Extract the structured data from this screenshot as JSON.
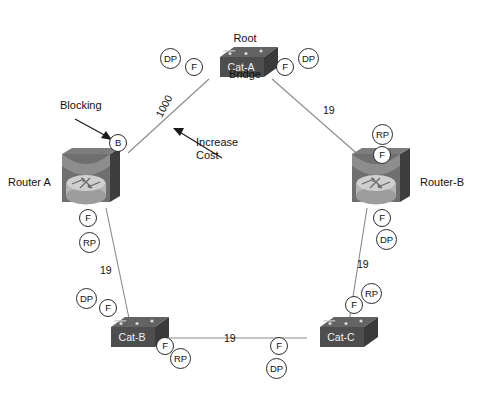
{
  "diagram": {
    "annotations": {
      "root_bridge": "Root\nBridge",
      "root_bridge_line1": "Root",
      "root_bridge_line2": "Bridge",
      "blocking": "Blocking",
      "increase_cost_line1": "Increase",
      "increase_cost_line2": "Cost"
    },
    "devices": [
      {
        "id": "cat-a",
        "name": "Cat-A",
        "type": "switch"
      },
      {
        "id": "router-a",
        "name": "Router A",
        "type": "router"
      },
      {
        "id": "router-b",
        "name": "Router-B",
        "type": "router"
      },
      {
        "id": "cat-b",
        "name": "Cat-B",
        "type": "switch"
      },
      {
        "id": "cat-c",
        "name": "Cat-C",
        "type": "switch"
      }
    ],
    "links": [
      {
        "id": "cata-routera",
        "from": "cat-a",
        "to": "router-a",
        "cost": "1000"
      },
      {
        "id": "cata-routerb",
        "from": "cat-a",
        "to": "router-b",
        "cost": "19"
      },
      {
        "id": "routera-catb",
        "from": "router-a",
        "to": "cat-b",
        "cost": "19"
      },
      {
        "id": "routerb-catc",
        "from": "router-b",
        "to": "cat-c",
        "cost": "19"
      },
      {
        "id": "catb-catc",
        "from": "cat-b",
        "to": "cat-c",
        "cost": "19"
      }
    ],
    "port_roles": [
      {
        "id": "cata-left-dp",
        "device": "cat-a",
        "label": "DP"
      },
      {
        "id": "cata-left-f",
        "device": "cat-a",
        "label": "F"
      },
      {
        "id": "cata-right-f",
        "device": "cat-a",
        "label": "F"
      },
      {
        "id": "cata-right-dp",
        "device": "cat-a",
        "label": "DP"
      },
      {
        "id": "routera-top-b",
        "device": "router-a",
        "label": "B"
      },
      {
        "id": "routera-bot-f",
        "device": "router-a",
        "label": "F"
      },
      {
        "id": "routera-bot-rp",
        "device": "router-a",
        "label": "RP"
      },
      {
        "id": "routerb-top-rp",
        "device": "router-b",
        "label": "RP"
      },
      {
        "id": "routerb-top-f",
        "device": "router-b",
        "label": "F"
      },
      {
        "id": "routerb-bot-f",
        "device": "router-b",
        "label": "F"
      },
      {
        "id": "routerb-bot-dp",
        "device": "router-b",
        "label": "DP"
      },
      {
        "id": "catb-top-dp",
        "device": "cat-b",
        "label": "DP"
      },
      {
        "id": "catb-top-f",
        "device": "cat-b",
        "label": "F"
      },
      {
        "id": "catb-right-f",
        "device": "cat-b",
        "label": "F"
      },
      {
        "id": "catb-right-rp",
        "device": "cat-b",
        "label": "RP"
      },
      {
        "id": "catc-top-rp",
        "device": "cat-c",
        "label": "RP"
      },
      {
        "id": "catc-top-f",
        "device": "cat-c",
        "label": "F"
      },
      {
        "id": "catc-left-f",
        "device": "cat-c",
        "label": "F"
      },
      {
        "id": "catc-left-dp",
        "device": "cat-c",
        "label": "DP"
      }
    ],
    "colors": {
      "background": "#ffffff",
      "line": "#8a8a8a",
      "text": "#111111",
      "device_dark": "#4a4a4a",
      "device_mid": "#6e6e6e",
      "device_light": "#9a9a9a",
      "circle_border": "#2b2b2b"
    }
  }
}
